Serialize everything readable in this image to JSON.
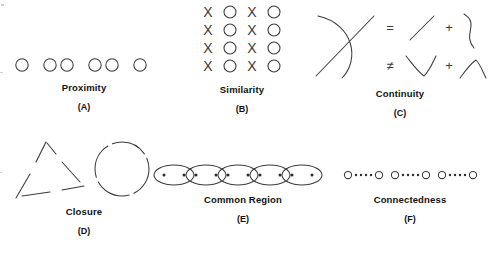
{
  "figure": {
    "background_color": "#ffffff",
    "stroke_color": "#3a3a3a",
    "text_color": "#111111"
  },
  "panels": [
    {
      "id": "proximity",
      "letter": "(A)",
      "caption": "Proximity",
      "art_type": "circle-row-grouped",
      "description": "A horizontal row of seven open circles arranged in groups by spacing: one, then a pair, then a pair, then one.",
      "groups": [
        1,
        2,
        2,
        1
      ],
      "shape": "open-circle",
      "circle_count": 6
    },
    {
      "id": "similarity",
      "letter": "(B)",
      "caption": "Similarity",
      "art_type": "xo-grid",
      "description": "A four by four grid whose columns alternate between the letter X and an open circle O.",
      "rows": 4,
      "columns": 4,
      "grid": [
        [
          "X",
          "O",
          "X",
          "O"
        ],
        [
          "X",
          "O",
          "X",
          "O"
        ],
        [
          "X",
          "O",
          "X",
          "O"
        ],
        [
          "X",
          "O",
          "X",
          "O"
        ]
      ]
    },
    {
      "id": "continuity",
      "letter": "(C)",
      "caption": "Continuity",
      "art_type": "crossing-curves-equation",
      "description": "A curve crossing a straight diagonal line, equal to a line plus a smooth curve, and not equal to a V shape plus a peak shape.",
      "operators": {
        "equals": "=",
        "not_equals": "≠",
        "plus": "+"
      }
    },
    {
      "id": "closure",
      "letter": "(D)",
      "caption": "Closure",
      "art_type": "broken-outlines",
      "description": "A triangle drawn with gaps in each side, next to a circle drawn with gaps in its outline.",
      "shapes": [
        "broken-triangle",
        "broken-circle"
      ]
    },
    {
      "id": "common-region",
      "letter": "(E)",
      "caption": "Common Region",
      "art_type": "ellipse-chain-with-dots",
      "description": "A horizontal chain of five overlapping ellipses, each enclosing two small dots.",
      "ellipse_count": 5,
      "dots_per_ellipse": 2
    },
    {
      "id": "connectedness",
      "letter": "(F)",
      "caption": "Connectedness",
      "art_type": "linked-circle-pairs",
      "description": "Three groups, each made of two open circles joined by a short row of small filled dots.",
      "group_count": 3,
      "dots_between": 4,
      "endpoints_per_group": 2
    }
  ]
}
